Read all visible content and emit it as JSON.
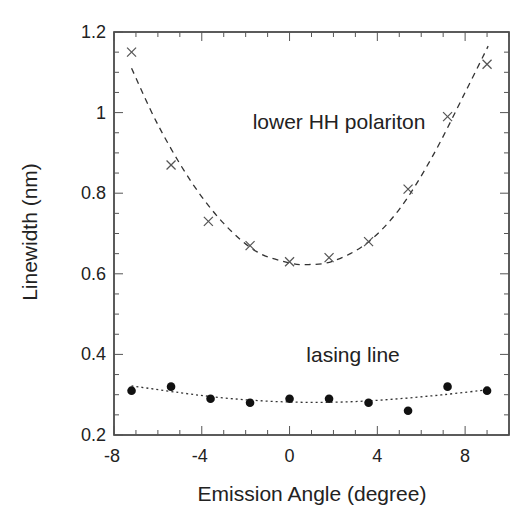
{
  "chart_data": {
    "type": "scatter",
    "title": "",
    "xlabel": "Emission Angle (degree)",
    "ylabel": "Linewidth (nm)",
    "xlim": [
      -8,
      10
    ],
    "ylim": [
      0.2,
      1.2
    ],
    "x_ticks": [
      -8,
      -4,
      0,
      4,
      8
    ],
    "x_tick_labels": [
      "-8",
      "-4",
      "0",
      "4",
      "8"
    ],
    "y_ticks": [
      0.2,
      0.4,
      0.6,
      0.8,
      1.0,
      1.2
    ],
    "y_tick_labels": [
      "0.2",
      "0.4",
      "0.6",
      "0.8",
      "1",
      "1.2"
    ],
    "x_minor_step": 1,
    "y_minor_step": 0.05,
    "grid": false,
    "legend": null,
    "series": [
      {
        "name": "lower HH polariton",
        "marker": "x",
        "color": "#555555",
        "x": [
          -7.2,
          -5.4,
          -3.7,
          -1.8,
          0.0,
          1.8,
          3.6,
          5.4,
          7.2,
          9.0
        ],
        "y": [
          1.15,
          0.87,
          0.73,
          0.67,
          0.63,
          0.64,
          0.68,
          0.81,
          0.99,
          1.12
        ],
        "fit": {
          "style": "dashed",
          "x": [
            -7.2,
            -6,
            -4.5,
            -3,
            -1.5,
            0,
            0.9,
            2,
            3.5,
            5,
            6.5,
            8,
            9.05
          ],
          "y": [
            1.11,
            0.97,
            0.83,
            0.725,
            0.655,
            0.627,
            0.623,
            0.632,
            0.675,
            0.76,
            0.89,
            1.05,
            1.165
          ]
        }
      },
      {
        "name": "lasing line",
        "marker": "filled-circle",
        "color": "#111111",
        "x": [
          -7.2,
          -5.4,
          -3.6,
          -1.8,
          0.0,
          1.8,
          3.6,
          5.4,
          7.2,
          9.0
        ],
        "y": [
          0.31,
          0.32,
          0.29,
          0.28,
          0.29,
          0.29,
          0.28,
          0.26,
          0.32,
          0.31
        ],
        "fit": {
          "style": "dotted",
          "x": [
            -7.2,
            -5,
            -3,
            -1,
            1,
            3,
            5,
            7,
            9
          ],
          "y": [
            0.322,
            0.305,
            0.292,
            0.284,
            0.281,
            0.283,
            0.29,
            0.3,
            0.312
          ]
        }
      }
    ],
    "annotations": [
      {
        "text": "lower HH polariton",
        "x": 1.8,
        "y": 0.96
      },
      {
        "text": "lasing line",
        "x": 1.8,
        "y": 0.38
      }
    ]
  }
}
